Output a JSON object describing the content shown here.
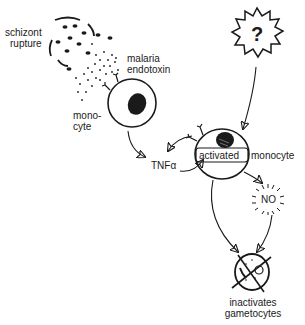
{
  "diagram": {
    "nodes": {
      "schizont": {
        "label_line1": "schizont",
        "label_line2": "rupture"
      },
      "endotoxin": {
        "label_line1": "malaria",
        "label_line2": "endotoxin"
      },
      "monocyte": {
        "label_line1": "mono-",
        "label_line2": "cyte"
      },
      "unknown": {
        "label": "?"
      },
      "activated": {
        "label_a": "activated",
        "label_b": "monocyte"
      },
      "tnf": {
        "label": "TNFα"
      },
      "no": {
        "label": "NO"
      },
      "gametocytes": {
        "label_line1": "inactivates",
        "label_line2": "gametocytes"
      }
    },
    "edges": [
      {
        "from": "monocyte",
        "to": "tnf"
      },
      {
        "from": "tnf",
        "to": "activated"
      },
      {
        "from": "activated",
        "to": "tnf"
      },
      {
        "from": "unknown",
        "to": "activated"
      },
      {
        "from": "activated",
        "to": "no"
      },
      {
        "from": "activated",
        "to": "gametocytes"
      },
      {
        "from": "no",
        "to": "gametocytes"
      }
    ]
  }
}
